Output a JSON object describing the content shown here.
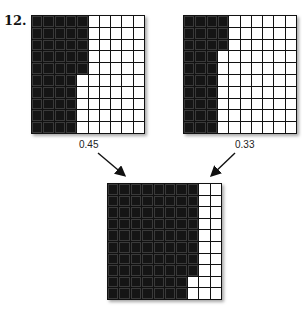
{
  "problem_number": "12.",
  "grids": {
    "left": {
      "value_label": "0.45",
      "shaded_per_row": [
        5,
        5,
        5,
        5,
        5,
        4,
        4,
        4,
        4,
        4
      ]
    },
    "right": {
      "value_label": "0.33",
      "shaded_per_row": [
        4,
        4,
        4,
        3,
        3,
        3,
        3,
        3,
        3,
        3
      ]
    },
    "bottom": {
      "shaded_per_row": [
        8,
        8,
        8,
        8,
        8,
        8,
        8,
        8,
        7,
        7
      ]
    }
  },
  "colors": {
    "shaded": "#151515",
    "unshaded": "#ffffff",
    "grid_line": "#111111"
  }
}
